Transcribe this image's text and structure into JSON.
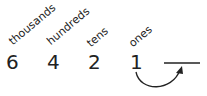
{
  "place_values": [
    {
      "label": "thousands",
      "digit": "6"
    },
    {
      "label": "hundreds",
      "digit": "4"
    },
    {
      "label": "tens",
      "digit": "2"
    },
    {
      "label": "ones",
      "digit": "1"
    }
  ],
  "blank": "",
  "colors": {
    "ink": "#222222",
    "background": "#ffffff"
  }
}
